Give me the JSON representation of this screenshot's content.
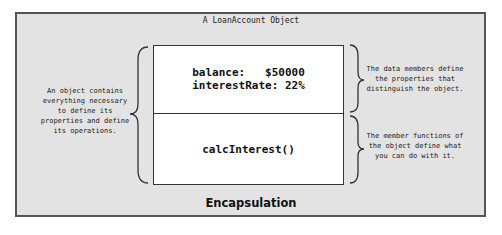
{
  "diagram": {
    "title": "A LoanAccount Object",
    "data_members": {
      "line1": "balance:   $50000",
      "line2": "interestRate: 22%"
    },
    "member_function": "calcInterest()",
    "caption": "Encapsulation",
    "annotations": {
      "left": [
        "An object contains",
        "everything necessary",
        "to define its",
        "properties and define",
        "its operations."
      ],
      "right_top": [
        "The data members define",
        "the properties that",
        "distinguish the object."
      ],
      "right_bottom": [
        "The member functions of",
        "the object define what",
        "you can do with it."
      ]
    },
    "colors": {
      "background_panel": "#e3e3e3",
      "object_box": "#ffffff",
      "border": "#333333"
    }
  }
}
